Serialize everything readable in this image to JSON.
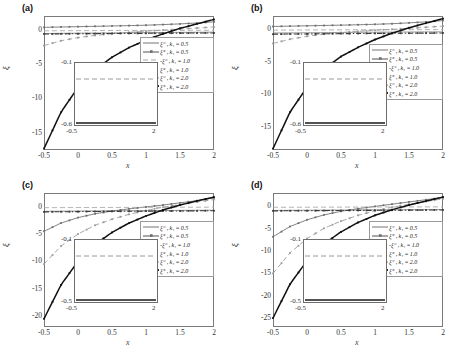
{
  "figure": {
    "layout": "2x2 grid of line plots",
    "xlabel": "x",
    "ylabel": "ξ",
    "panel_tags": [
      "(a)",
      "(b)",
      "(c)",
      "(d)"
    ]
  },
  "legend_common": {
    "entries": [
      {
        "label": "ξ⁻ , k₁ = 0.5",
        "style": "solid",
        "marker": "none",
        "color": "#8c8c8c"
      },
      {
        "label": "ξ⁺ , k₁ = 0.5",
        "style": "solid",
        "marker": "dot",
        "color": "#6e6e6e"
      },
      {
        "label": "-ξ⁻ , k₁ = 1.0",
        "style": "dashed",
        "marker": "none",
        "color": "#a8a8a8"
      },
      {
        "label": "ξ⁺ , k₁ = 1.0",
        "style": "dashed",
        "marker": "dot",
        "color": "#9a9a9a"
      },
      {
        "label": "ξ⁻ , k₁ = 2.0",
        "style": "dashdot",
        "marker": "dot",
        "color": "#3a3a3a"
      },
      {
        "label": "ξ⁺ , k₁ = 2.0",
        "style": "solid-thick",
        "marker": "dot",
        "color": "#111111"
      }
    ]
  },
  "chart_data": [
    {
      "type": "line",
      "panel": "(a)",
      "title": "",
      "xlabel": "x",
      "ylabel": "ξ",
      "xlim": [
        -0.5,
        2
      ],
      "ylim": [
        -17.5,
        2
      ],
      "xticks": [
        -0.5,
        0,
        0.5,
        1,
        1.5,
        2
      ],
      "xticklabels": [
        "-0.5",
        "0",
        "0.5",
        "1",
        "1.5",
        "2"
      ],
      "yticks": [
        0,
        -5,
        -10,
        -15
      ],
      "yticklabels": [
        "0",
        "-5",
        "-10",
        "-15"
      ],
      "grid": false,
      "legend_position": "right-upper",
      "x": [
        -0.5,
        -0.25,
        0,
        0.25,
        0.5,
        0.75,
        1,
        1.25,
        1.5,
        1.75,
        2
      ],
      "series": [
        {
          "name": "ξ⁻ , k₁ = 0.5",
          "values": [
            -0.55,
            -0.52,
            -0.5,
            -0.48,
            -0.46,
            -0.44,
            -0.42,
            -0.4,
            -0.38,
            -0.37,
            -0.35
          ]
        },
        {
          "name": "ξ⁺ , k₁ = 0.5",
          "values": [
            0.35,
            0.4,
            0.45,
            0.5,
            0.55,
            0.6,
            0.66,
            0.75,
            0.85,
            0.98,
            1.15
          ]
        },
        {
          "name": "-ξ⁻ , k₁ = 1.0",
          "values": [
            -0.15,
            -0.14,
            -0.13,
            -0.12,
            -0.11,
            -0.1,
            -0.1,
            -0.09,
            -0.09,
            -0.08,
            -0.08
          ]
        },
        {
          "name": "ξ⁺ , k₁ = 1.0",
          "values": [
            -2.3,
            -1.6,
            -1.15,
            -0.82,
            -0.58,
            -0.38,
            -0.2,
            -0.05,
            0.1,
            0.25,
            0.4
          ]
        },
        {
          "name": "ξ⁻ , k₁ = 2.0",
          "values": [
            -0.62,
            -0.6,
            -0.58,
            -0.56,
            -0.55,
            -0.53,
            -0.52,
            -0.5,
            -0.49,
            -0.48,
            -0.47
          ]
        },
        {
          "name": "ξ⁺ , k₁ = 2.0",
          "values": [
            -17.3,
            -12.0,
            -8.4,
            -5.8,
            -4.0,
            -2.6,
            -1.5,
            -0.6,
            0.2,
            0.85,
            1.5
          ]
        }
      ],
      "inset": {
        "ylim": [
          -0.6,
          -0.1
        ],
        "xlim": [
          -0.5,
          2
        ],
        "yticklabels": [
          "-0.1",
          "-0.6"
        ],
        "xticklabels": [
          "-0.5",
          "2"
        ]
      }
    },
    {
      "type": "line",
      "panel": "(b)",
      "title": "",
      "xlabel": "x",
      "ylabel": "ξ",
      "xlim": [
        -0.5,
        2
      ],
      "ylim": [
        -18.5,
        2
      ],
      "xticks": [
        -0.5,
        0,
        0.5,
        1,
        1.5,
        2
      ],
      "xticklabels": [
        "-0.5",
        "0",
        "0.5",
        "1",
        "1.5",
        "2"
      ],
      "yticks": [
        0,
        -5,
        -10,
        -15
      ],
      "yticklabels": [
        "0",
        "-5",
        "-10",
        "-15"
      ],
      "grid": false,
      "legend_position": "right-middle",
      "x": [
        -0.5,
        -0.25,
        0,
        0.25,
        0.5,
        0.75,
        1,
        1.25,
        1.5,
        1.75,
        2
      ],
      "series": [
        {
          "name": "ξ⁻ , k₁ = 0.5",
          "values": [
            -0.6,
            -0.58,
            -0.56,
            -0.54,
            -0.52,
            -0.5,
            -0.48,
            -0.46,
            -0.45,
            -0.43,
            -0.42
          ]
        },
        {
          "name": "ξ⁺ , k₁ = 0.5",
          "values": [
            0.4,
            0.45,
            0.5,
            0.55,
            0.6,
            0.66,
            0.73,
            0.82,
            0.95,
            1.1,
            1.3
          ]
        },
        {
          "name": "-ξ⁻ , k₁ = 1.0",
          "values": [
            -0.16,
            -0.15,
            -0.14,
            -0.13,
            -0.12,
            -0.11,
            -0.1,
            -0.1,
            -0.09,
            -0.09,
            -0.08
          ]
        },
        {
          "name": "ξ⁺ , k₁ = 1.0",
          "values": [
            -2.2,
            -1.55,
            -1.1,
            -0.78,
            -0.54,
            -0.35,
            -0.18,
            -0.03,
            0.12,
            0.28,
            0.45
          ]
        },
        {
          "name": "ξ⁻ , k₁ = 2.0",
          "values": [
            -0.78,
            -0.76,
            -0.74,
            -0.72,
            -0.7,
            -0.68,
            -0.66,
            -0.65,
            -0.63,
            -0.62,
            -0.6
          ]
        },
        {
          "name": "ξ⁺ , k₁ = 2.0",
          "values": [
            -18.3,
            -12.7,
            -8.9,
            -6.1,
            -4.2,
            -2.8,
            -1.6,
            -0.65,
            0.2,
            0.9,
            1.6
          ]
        }
      ],
      "inset": {
        "ylim": [
          -0.6,
          -0.1
        ],
        "xlim": [
          -0.5,
          2
        ],
        "yticklabels": [
          "-0.1",
          "-0.6"
        ],
        "xticklabels": [
          "-0.5",
          "2"
        ]
      }
    },
    {
      "type": "line",
      "panel": "(c)",
      "title": "",
      "xlabel": "x",
      "ylabel": "ξ",
      "xlim": [
        -0.5,
        2
      ],
      "ylim": [
        -22,
        2.5
      ],
      "xticks": [
        -0.5,
        0,
        0.5,
        1,
        1.5,
        2
      ],
      "xticklabels": [
        "-0.5",
        "0",
        "0.5",
        "1",
        "1.5",
        "2"
      ],
      "yticks": [
        0,
        -5,
        -10,
        -15,
        -20
      ],
      "yticklabels": [
        "0",
        "-5",
        "-10",
        "-15",
        "-20"
      ],
      "grid": false,
      "legend_position": "right-middle",
      "x": [
        -0.5,
        -0.25,
        0,
        0.25,
        0.5,
        0.75,
        1,
        1.25,
        1.5,
        1.75,
        2
      ],
      "series": [
        {
          "name": "ξ⁻ , k₁ = 0.5",
          "values": [
            -0.85,
            -0.83,
            -0.8,
            -0.78,
            -0.76,
            -0.74,
            -0.72,
            -0.7,
            -0.68,
            -0.66,
            -0.64
          ]
        },
        {
          "name": "ξ⁺ , k₁ = 0.5",
          "values": [
            -4.5,
            -3.0,
            -2.0,
            -1.3,
            -0.8,
            -0.4,
            -0.05,
            0.3,
            0.7,
            1.1,
            1.6
          ]
        },
        {
          "name": "-ξ⁻ , k₁ = 1.0",
          "values": [
            -0.18,
            -0.17,
            -0.16,
            -0.15,
            -0.14,
            -0.13,
            -0.12,
            -0.11,
            -0.1,
            -0.1,
            -0.09
          ]
        },
        {
          "name": "ξ⁺ , k₁ = 1.0",
          "values": [
            -10.5,
            -7.2,
            -5.0,
            -3.4,
            -2.3,
            -1.4,
            -0.7,
            -0.1,
            0.4,
            0.85,
            1.3
          ]
        },
        {
          "name": "ξ⁻ , k₁ = 2.0",
          "values": [
            -0.95,
            -0.93,
            -0.9,
            -0.88,
            -0.86,
            -0.84,
            -0.82,
            -0.8,
            -0.78,
            -0.76,
            -0.74
          ]
        },
        {
          "name": "ξ⁺ , k₁ = 2.0",
          "values": [
            -20.5,
            -14.3,
            -10.0,
            -6.9,
            -4.7,
            -3.0,
            -1.7,
            -0.6,
            0.3,
            1.05,
            1.75
          ]
        }
      ],
      "inset": {
        "ylim": [
          -0.5,
          -0.1
        ],
        "xlim": [
          -0.5,
          2
        ],
        "yticklabels": [
          "-0.1",
          "-0.5"
        ],
        "xticklabels": [
          "-0.5",
          "2"
        ]
      }
    },
    {
      "type": "line",
      "panel": "(d)",
      "title": "",
      "xlabel": "x",
      "ylabel": "ξ",
      "xlim": [
        -0.5,
        2
      ],
      "ylim": [
        -27,
        3
      ],
      "xticks": [
        -0.5,
        0,
        0.5,
        1,
        1.5,
        2
      ],
      "xticklabels": [
        "-0.5",
        "0",
        "0.5",
        "1",
        "1.5",
        "2"
      ],
      "yticks": [
        0,
        -5,
        -10,
        -15,
        -20,
        -25
      ],
      "yticklabels": [
        "0",
        "-5",
        "-10",
        "-15",
        "-20",
        "-25"
      ],
      "grid": false,
      "legend_position": "right-middle",
      "x": [
        -0.5,
        -0.25,
        0,
        0.25,
        0.5,
        0.75,
        1,
        1.25,
        1.5,
        1.75,
        2
      ],
      "series": [
        {
          "name": "ξ⁻ , k₁ = 0.5",
          "values": [
            -0.9,
            -0.88,
            -0.86,
            -0.84,
            -0.82,
            -0.8,
            -0.78,
            -0.76,
            -0.74,
            -0.72,
            -0.7
          ]
        },
        {
          "name": "ξ⁺ , k₁ = 0.5",
          "values": [
            -6.8,
            -4.5,
            -3.0,
            -1.9,
            -1.1,
            -0.5,
            0.0,
            0.5,
            1.0,
            1.5,
            2.0
          ]
        },
        {
          "name": "-ξ⁻ , k₁ = 1.0",
          "values": [
            -0.2,
            -0.19,
            -0.18,
            -0.17,
            -0.16,
            -0.15,
            -0.14,
            -0.13,
            -0.12,
            -0.11,
            -0.1
          ]
        },
        {
          "name": "ξ⁺ , k₁ = 1.0",
          "values": [
            -15.0,
            -10.4,
            -7.2,
            -4.9,
            -3.3,
            -2.0,
            -1.0,
            -0.2,
            0.5,
            1.1,
            1.7
          ]
        },
        {
          "name": "ξ⁻ , k₁ = 2.0",
          "values": [
            -1.0,
            -0.98,
            -0.96,
            -0.94,
            -0.92,
            -0.9,
            -0.88,
            -0.86,
            -0.84,
            -0.82,
            -0.8
          ]
        },
        {
          "name": "ξ⁺ , k₁ = 2.0",
          "values": [
            -25.0,
            -17.4,
            -12.2,
            -8.4,
            -5.7,
            -3.6,
            -2.0,
            -0.75,
            0.3,
            1.2,
            2.1
          ]
        }
      ],
      "inset": {
        "ylim": [
          -0.5,
          -0.1
        ],
        "xlim": [
          -0.5,
          2
        ],
        "yticklabels": [
          "-0.1",
          "-0.5"
        ],
        "xticklabels": [
          "-0.5",
          "2"
        ]
      }
    }
  ]
}
